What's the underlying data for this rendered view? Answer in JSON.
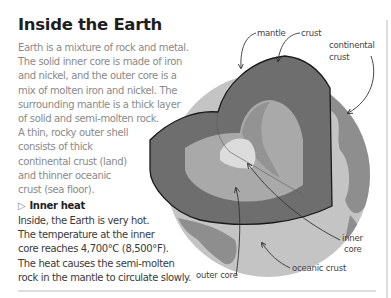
{
  "title": "Inside the Earth",
  "intro_lines": [
    "Earth is a mixture of rock and metal.",
    "The solid inner core is made of iron",
    "and nickel, and the outer core is a",
    "mix of molten iron and nickel. The",
    "surrounding mantle is a thick layer",
    "of solid and semi-molten rock.",
    "A thin, rocky outer shell",
    "consists of thick",
    "continental crust (land)",
    "and thinner oceanic",
    "crust (sea floor)."
  ],
  "inner_heat": {
    "icon": "triangle-right-outline-icon",
    "heading": "Inner heat",
    "lines": [
      "Inside, the Earth is very hot.",
      "The temperature at the inner",
      "core reaches 4,700°C (8,500°F).",
      "The heat causes the semi-molten",
      "rock in the mantle to circulate slowly."
    ]
  },
  "diagram": {
    "labels": {
      "mantle": "mantle",
      "crust": "crust",
      "continental_crust_1": "continental",
      "continental_crust_2": "crust",
      "inner_core_1": "inner",
      "inner_core_2": "core",
      "outer_core": "outer core",
      "oceanic_crust": "oceanic crust"
    },
    "colors": {
      "ocean": "#c4c4c4",
      "continent": "#8e8e8e",
      "mantle": "#6e6e6e",
      "outer_core": "#a9a9a9",
      "inner_core": "#dcdcdc",
      "outline": "#1a1a1a"
    }
  }
}
